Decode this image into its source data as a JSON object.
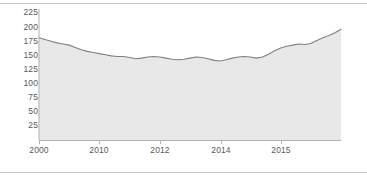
{
  "chart_data": {
    "type": "area",
    "title": "",
    "subtitle": "",
    "xlabel": "",
    "ylabel": "",
    "grid": false,
    "legend": null,
    "colors": {
      "line": "#808080",
      "fill": "#e8e8e8",
      "axis": "#b0b0b0",
      "tick_text": "#59595b",
      "rule": "#c9c9c9",
      "background": "#ffffff"
    },
    "yaxis": {
      "ticks": [
        25,
        50,
        75,
        100,
        125,
        150,
        175,
        200,
        225
      ],
      "tick_labels": [
        "25",
        "50",
        "75",
        "100",
        "125",
        "150",
        "175",
        "200",
        "225"
      ],
      "ylim": [
        0,
        232
      ]
    },
    "xaxis": {
      "ticks": [
        2000,
        2010,
        2012,
        2014,
        2015
      ],
      "tick_labels": [
        "2000",
        "2010",
        "2012",
        "2014",
        "2015"
      ],
      "tick_positions_px": [
        39,
        99,
        160,
        221,
        281
      ],
      "xlim_px": [
        39,
        341
      ]
    },
    "x": [
      0,
      1,
      2,
      3,
      4,
      5,
      6,
      7,
      8,
      9,
      10,
      11,
      12,
      13,
      14,
      15,
      16,
      17,
      18,
      19,
      20,
      21,
      22,
      23,
      24,
      25,
      26,
      27,
      28,
      29,
      30,
      31,
      32,
      33,
      34,
      35,
      36,
      37,
      38,
      39,
      40,
      41,
      42,
      43,
      44,
      45,
      46,
      47,
      48,
      49,
      50
    ],
    "values": [
      181,
      178,
      175,
      172,
      170,
      168,
      164,
      160,
      157,
      155,
      153,
      151,
      149,
      148,
      148,
      146,
      144,
      145,
      147,
      148,
      147,
      145,
      143,
      142,
      143,
      145,
      147,
      146,
      144,
      141,
      140,
      142,
      145,
      147,
      148,
      147,
      145,
      147,
      152,
      158,
      163,
      166,
      168,
      170,
      169,
      171,
      176,
      181,
      185,
      190,
      196
    ],
    "series_name": "value"
  }
}
